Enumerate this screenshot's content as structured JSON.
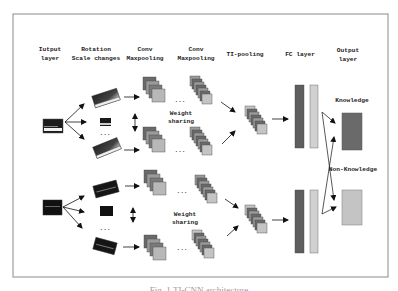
{
  "figure": {
    "caption": "Fig. 1  TI-CNN architecture",
    "frame_color": "#8a8a8a"
  },
  "columns": {
    "input": {
      "line1": "Iutput",
      "line2": "layer"
    },
    "rotation": {
      "line1": "Rotation",
      "line2": "Scale changes"
    },
    "conv1": {
      "line1": "Conv",
      "line2": "Maxpooling"
    },
    "conv2": {
      "line1": "Conv",
      "line2": "Maxpooling"
    },
    "tipool": {
      "line1": "TI-pooling"
    },
    "fc": {
      "line1": "FC layer"
    },
    "output": {
      "line1": "Output",
      "line2": "layer"
    }
  },
  "annotations": {
    "weight_sharing_top": {
      "line1": "Weight",
      "line2": "sharing"
    },
    "weight_sharing_bottom": {
      "line1": "Weight",
      "line2": "sharing"
    },
    "ellipsis": "···",
    "knowledge": "Knowledge",
    "non_knowledge": "Non-Knowledge"
  },
  "colors": {
    "dark": "#5e5e5e",
    "mid": "#8c8c8c",
    "light": "#c4c4c4",
    "lighter": "#d8d8d8",
    "black": "#111111"
  }
}
